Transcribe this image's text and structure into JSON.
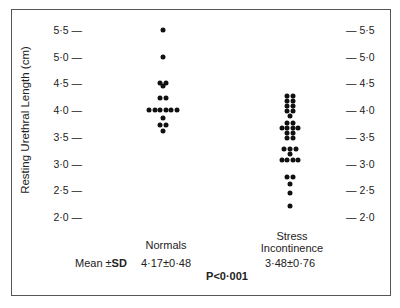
{
  "chart_data": {
    "type": "scatter",
    "subtype": "dot-plot",
    "title": "",
    "xlabel": "",
    "ylabel": "Resting Urethral Length (cm)",
    "ylim": [
      2.0,
      5.5
    ],
    "yticks": [
      "2·0",
      "2·5",
      "3·0",
      "3·5",
      "4·0",
      "4·5",
      "5·0",
      "5·5"
    ],
    "ytick_values": [
      2.0,
      2.5,
      3.0,
      3.5,
      4.0,
      4.5,
      5.0,
      5.5
    ],
    "right_axis_duplicate": true,
    "grid": false,
    "series": [
      {
        "name": "Normals",
        "mean_sd": "4·17±0·48",
        "n": 17,
        "rows": [
          {
            "value": 5.5,
            "count": 1
          },
          {
            "value": 5.0,
            "count": 1
          },
          {
            "value": 4.5,
            "count": 2
          },
          {
            "value": 4.45,
            "count": 1
          },
          {
            "value": 4.22,
            "count": 2
          },
          {
            "value": 4.0,
            "count": 6
          },
          {
            "value": 3.85,
            "count": 1
          },
          {
            "value": 3.72,
            "count": 2
          },
          {
            "value": 3.6,
            "count": 1
          }
        ]
      },
      {
        "name": "Stress Incontinence",
        "mean_sd": "3·48±0·76",
        "n": 32,
        "rows": [
          {
            "value": 4.26,
            "count": 2
          },
          {
            "value": 4.17,
            "count": 2
          },
          {
            "value": 4.07,
            "count": 2
          },
          {
            "value": 3.98,
            "count": 2
          },
          {
            "value": 3.89,
            "count": 1
          },
          {
            "value": 3.76,
            "count": 2
          },
          {
            "value": 3.66,
            "count": 4
          },
          {
            "value": 3.57,
            "count": 2
          },
          {
            "value": 3.48,
            "count": 2
          },
          {
            "value": 3.27,
            "count": 3
          },
          {
            "value": 3.18,
            "count": 1
          },
          {
            "value": 3.07,
            "count": 4
          },
          {
            "value": 2.75,
            "count": 2
          },
          {
            "value": 2.62,
            "count": 1
          },
          {
            "value": 2.45,
            "count": 1
          },
          {
            "value": 2.2,
            "count": 1
          }
        ]
      }
    ],
    "annotations": {
      "mean_label": "Mean ±",
      "sd_label": "SD",
      "p_value": "P<0·001"
    }
  },
  "labels": {
    "normals": "Normals",
    "stress_line1": "Stress",
    "stress_line2": "Incontinence",
    "normals_stat": "4·17±0·48",
    "stress_stat": "3·48±0·76",
    "mean": "Mean ±",
    "sd": "SD",
    "p": "P<0·001"
  }
}
